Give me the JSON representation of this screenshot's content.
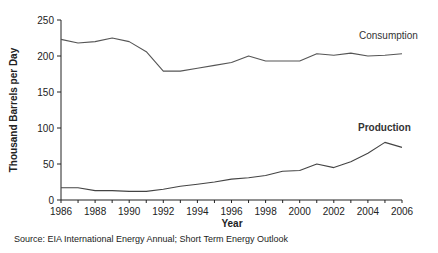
{
  "chart_data": {
    "type": "line",
    "title": "",
    "xlabel": "Year",
    "ylabel": "Thousand Barrels per Day",
    "x": [
      1986,
      1987,
      1988,
      1989,
      1990,
      1991,
      1992,
      1993,
      1994,
      1995,
      1996,
      1997,
      1998,
      1999,
      2000,
      2001,
      2002,
      2003,
      2004,
      2005,
      2006
    ],
    "xticks": [
      "1986",
      "1988",
      "1990",
      "1992",
      "1994",
      "1996",
      "1998",
      "2000",
      "2002",
      "2004",
      "2006"
    ],
    "yticks": [
      "0",
      "50",
      "100",
      "150",
      "200",
      "250"
    ],
    "xlim": [
      1986,
      2006
    ],
    "ylim": [
      0,
      250
    ],
    "grid": false,
    "legend": "inline labels at right end of lines",
    "series": [
      {
        "name": "Consumption",
        "label_style": "normal",
        "color": "#555555",
        "values": [
          223,
          218,
          220,
          225,
          220,
          206,
          179,
          179,
          183,
          187,
          191,
          200,
          193,
          193,
          193,
          203,
          201,
          204,
          200,
          201,
          203
        ]
      },
      {
        "name": "Production",
        "label_style": "bold",
        "color": "#444444",
        "values": [
          17,
          17,
          13,
          13,
          12,
          12,
          15,
          19,
          22,
          25,
          29,
          31,
          34,
          40,
          41,
          50,
          45,
          53,
          65,
          80,
          73
        ]
      }
    ],
    "annotations": [
      "Consumption",
      "Production"
    ],
    "source": "Source: EIA International Energy Annual; Short Term Energy Outlook"
  },
  "labels": {
    "xlabel": "Year",
    "ylabel": "Thousand Barrels per Day",
    "consumption": "Consumption",
    "production": "Production",
    "source": "Source: EIA International Energy Annual; Short Term Energy Outlook"
  }
}
